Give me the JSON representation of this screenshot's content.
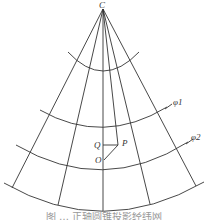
{
  "diagram": {
    "type": "conic-projection-graticule",
    "apex_label": "C",
    "parallel_labels": [
      "φ1",
      "φ2"
    ],
    "point_labels": {
      "Q": "Q",
      "P": "P",
      "O": "O"
    },
    "line_color": "#333333",
    "caption": "图 … 正轴圆锥投影经纬网"
  }
}
